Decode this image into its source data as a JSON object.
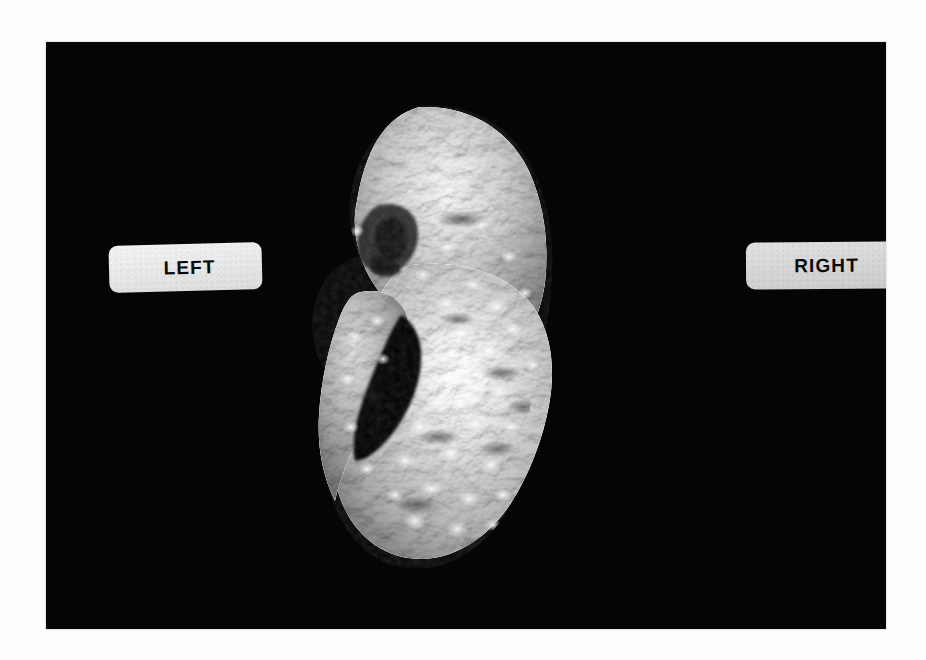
{
  "figure": {
    "panel_letter": "C",
    "background_color": "#fdfdfd",
    "panel_background_color": "#050505",
    "panel_left": 46,
    "panel_top": 42,
    "panel_width": 840,
    "panel_height": 587
  },
  "labels": {
    "left": {
      "text": "LEFT",
      "box_color": "#e8e8e8",
      "text_color": "#0a0a0a"
    },
    "right": {
      "text": "RIGHT",
      "box_color": "#d6d6d6",
      "text_color": "#0a0a0a"
    }
  },
  "render": {
    "modality_description": "3D volume-rendered grayscale surface reconstruction of an embryo/fetus shown in profile",
    "surface_tone_mid": "#9a9a9a",
    "surface_tone_highlight": "#f2f2f2",
    "surface_tone_shadow": "#3a3a3a",
    "void_color": "#050505"
  }
}
